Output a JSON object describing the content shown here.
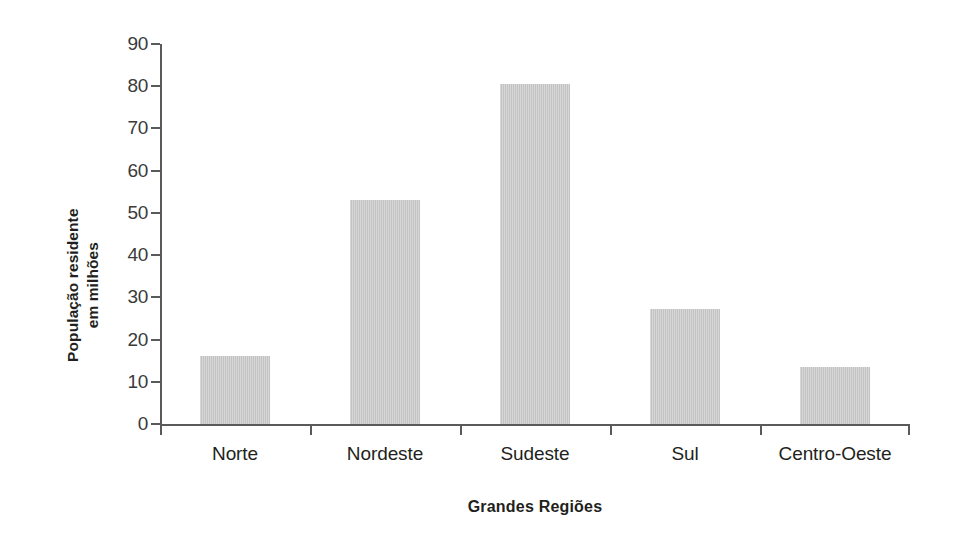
{
  "chart_data": {
    "type": "bar",
    "title": "",
    "subtitle": "",
    "xlabel": "Grandes Regiões",
    "ylabel": "População residente\nem milhões",
    "ylabel_lines": [
      "População residente",
      "em milhões"
    ],
    "categories": [
      "Norte",
      "Nordeste",
      "Sudeste",
      "Sul",
      "Centro-Oeste"
    ],
    "values": [
      16.0,
      53.0,
      80.5,
      27.2,
      13.6
    ],
    "ylim": [
      0,
      90
    ],
    "ytick_values": [
      0,
      10,
      20,
      30,
      40,
      50,
      60,
      70,
      80,
      90
    ],
    "ytick_labels": [
      "0",
      "10",
      "20",
      "30",
      "40",
      "50",
      "60",
      "70",
      "80",
      "90"
    ],
    "grid": false,
    "legend": false,
    "legend_position": "none",
    "bar_color": "#c3c3c3",
    "axis_color": "#5a5a5a",
    "text_color": "#231f20",
    "background_color": "#ffffff"
  }
}
